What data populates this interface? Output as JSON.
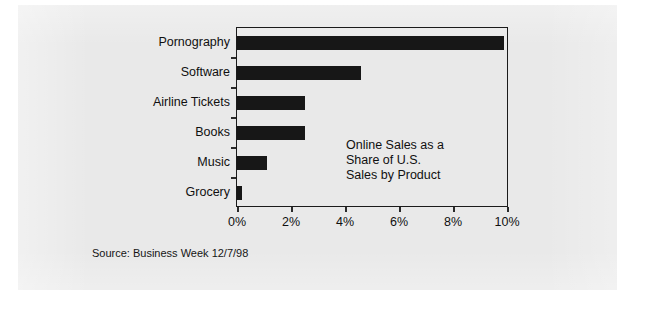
{
  "figure": {
    "source_note": "Source: Business Week 12/7/98",
    "annotation_lines": [
      "Online Sales as a",
      "Share of U.S.",
      "Sales by Product"
    ],
    "annotation_text": "Online Sales as a Share of U.S. Sales by Product",
    "colors": {
      "card_background": "#e9e9e9",
      "page_background": "#ffffff",
      "bar": "#171717",
      "axis": "#1b1b1b",
      "text": "#101010"
    }
  },
  "chart_data": {
    "type": "bar",
    "orientation": "horizontal",
    "title": "",
    "subtitle": "",
    "annotation": "Online Sales as a Share of U.S. Sales by Product",
    "categories": [
      "Pornography",
      "Software",
      "Airline Tickets",
      "Books",
      "Music",
      "Grocery"
    ],
    "values": [
      9.9,
      4.6,
      2.5,
      2.5,
      1.1,
      0.2
    ],
    "xlabel": "",
    "ylabel": "",
    "xlim": [
      0,
      10
    ],
    "xticks": [
      0,
      2,
      4,
      6,
      8,
      10
    ],
    "xticklabels": [
      "0%",
      "2%",
      "4%",
      "6%",
      "8%",
      "10%"
    ],
    "value_unit": "%",
    "grid": false,
    "legend": false,
    "series": [
      {
        "name": "Online share of U.S. sales",
        "values": [
          9.9,
          4.6,
          2.5,
          2.5,
          1.1,
          0.2
        ]
      }
    ]
  }
}
